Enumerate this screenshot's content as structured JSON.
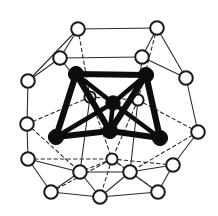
{
  "figure": {
    "title": "Polyhedral cluster structure",
    "background_color": "#ffffff",
    "width": 218,
    "height": 216
  },
  "style": {
    "outer_node_fill": "#ffffff",
    "outer_node_stroke": "#1a1a1a",
    "outer_node_stroke_width": 2.0,
    "outer_node_radius": 6.5,
    "outer_node_small_radius": 5.4,
    "inner_node_fill": "#0d0d0d",
    "inner_node_stroke": "#0d0d0d",
    "inner_node_radius": 7.4,
    "cage_bond_color": "#2b2b2b",
    "cage_bond_width": 1.1,
    "cage_bond_dash": "3.5 3",
    "inner_bond_color": "#0d0d0d",
    "inner_bond_width": 6.2,
    "inner_bond_thin_width": 4.6
  },
  "chart_data": {
    "type": "scatter",
    "title": "Polyhedral cluster structure",
    "xlabel": "",
    "ylabel": "",
    "xlim": [
      0,
      218
    ],
    "ylim": [
      0,
      216
    ],
    "grid": false,
    "legend": null,
    "series": [
      {
        "name": "outer-cage-atoms",
        "marker": "open-circle",
        "color": "#ffffff",
        "edge_color": "#1a1a1a",
        "points": [
          {
            "id": "O1",
            "x": 78,
            "y": 29,
            "r": 6.8,
            "layer": "front"
          },
          {
            "id": "O2",
            "x": 157,
            "y": 28,
            "r": 6.8,
            "layer": "front"
          },
          {
            "id": "O3",
            "x": 60,
            "y": 58,
            "r": 6.8,
            "layer": "front"
          },
          {
            "id": "O4",
            "x": 142,
            "y": 57,
            "r": 6.8,
            "layer": "front"
          },
          {
            "id": "O5",
            "x": 28,
            "y": 81,
            "r": 6.8,
            "layer": "front"
          },
          {
            "id": "O6",
            "x": 186,
            "y": 78,
            "r": 6.8,
            "layer": "front"
          },
          {
            "id": "O7",
            "x": 27,
            "y": 124,
            "r": 6.8,
            "layer": "front"
          },
          {
            "id": "O8",
            "x": 198,
            "y": 132,
            "r": 6.8,
            "layer": "front"
          },
          {
            "id": "O9",
            "x": 28,
            "y": 159,
            "r": 6.8,
            "layer": "front"
          },
          {
            "id": "O10",
            "x": 173,
            "y": 165,
            "r": 6.8,
            "layer": "front"
          },
          {
            "id": "O11",
            "x": 80,
            "y": 172,
            "r": 6.8,
            "layer": "front"
          },
          {
            "id": "O12",
            "x": 130,
            "y": 172,
            "r": 6.8,
            "layer": "front"
          },
          {
            "id": "O13",
            "x": 51,
            "y": 192,
            "r": 6.8,
            "layer": "front"
          },
          {
            "id": "O14",
            "x": 100,
            "y": 197,
            "r": 6.8,
            "layer": "front"
          },
          {
            "id": "O15",
            "x": 158,
            "y": 192,
            "r": 6.8,
            "layer": "front"
          },
          {
            "id": "O16",
            "x": 90,
            "y": 97,
            "r": 5.6,
            "layer": "behind"
          },
          {
            "id": "O17",
            "x": 138,
            "y": 100,
            "r": 5.6,
            "layer": "behind"
          },
          {
            "id": "O18",
            "x": 112,
            "y": 159,
            "r": 5.6,
            "layer": "behind"
          }
        ]
      },
      {
        "name": "inner-cluster-atoms",
        "marker": "filled-circle",
        "color": "#0d0d0d",
        "points": [
          {
            "id": "B1",
            "x": 76,
            "y": 74,
            "r": 7.6
          },
          {
            "id": "B2",
            "x": 146,
            "y": 75,
            "r": 7.6
          },
          {
            "id": "B3",
            "x": 113,
            "y": 103,
            "r": 7.2
          },
          {
            "id": "B4",
            "x": 56,
            "y": 137,
            "r": 7.6
          },
          {
            "id": "B5",
            "x": 110,
            "y": 131,
            "r": 7.6
          },
          {
            "id": "B6",
            "x": 160,
            "y": 138,
            "r": 7.6
          }
        ]
      }
    ],
    "edges": {
      "cage_solid": [
        [
          "O1",
          "O2"
        ],
        [
          "O1",
          "O3"
        ],
        [
          "O1",
          "O5"
        ],
        [
          "O2",
          "O4"
        ],
        [
          "O2",
          "O6"
        ],
        [
          "O3",
          "O4"
        ],
        [
          "O3",
          "O5"
        ],
        [
          "O4",
          "O6"
        ],
        [
          "O5",
          "O7"
        ],
        [
          "O7",
          "O9"
        ],
        [
          "O6",
          "O8"
        ],
        [
          "O8",
          "O10"
        ],
        [
          "O9",
          "O11"
        ],
        [
          "O9",
          "O13"
        ],
        [
          "O11",
          "O12"
        ],
        [
          "O11",
          "O13"
        ],
        [
          "O11",
          "O14"
        ],
        [
          "O12",
          "O14"
        ],
        [
          "O12",
          "O15"
        ],
        [
          "O12",
          "O10"
        ],
        [
          "O10",
          "O15"
        ],
        [
          "O13",
          "O14"
        ],
        [
          "O14",
          "O15"
        ],
        [
          "O3",
          "O16"
        ],
        [
          "O4",
          "O17"
        ],
        [
          "O16",
          "O11"
        ],
        [
          "O17",
          "O12"
        ]
      ],
      "cage_dashed": [
        [
          "O1",
          "O16"
        ],
        [
          "O2",
          "O17"
        ],
        [
          "O16",
          "O17"
        ],
        [
          "O7",
          "O16"
        ],
        [
          "O8",
          "O17"
        ],
        [
          "O16",
          "O18"
        ],
        [
          "O17",
          "O18"
        ],
        [
          "O18",
          "O11"
        ],
        [
          "O18",
          "O12"
        ],
        [
          "O18",
          "O14"
        ],
        [
          "O7",
          "O11"
        ],
        [
          "O8",
          "O12"
        ],
        [
          "O9",
          "O18"
        ],
        [
          "O10",
          "O18"
        ],
        [
          "O13",
          "O18"
        ],
        [
          "O15",
          "O18"
        ]
      ],
      "inner_bonds": [
        [
          "B1",
          "B2"
        ],
        [
          "B1",
          "B3"
        ],
        [
          "B1",
          "B4"
        ],
        [
          "B1",
          "B5"
        ],
        [
          "B2",
          "B3"
        ],
        [
          "B2",
          "B5"
        ],
        [
          "B2",
          "B6"
        ],
        [
          "B3",
          "B4"
        ],
        [
          "B3",
          "B5"
        ],
        [
          "B3",
          "B6"
        ],
        [
          "B4",
          "B5"
        ],
        [
          "B5",
          "B6"
        ]
      ]
    }
  }
}
